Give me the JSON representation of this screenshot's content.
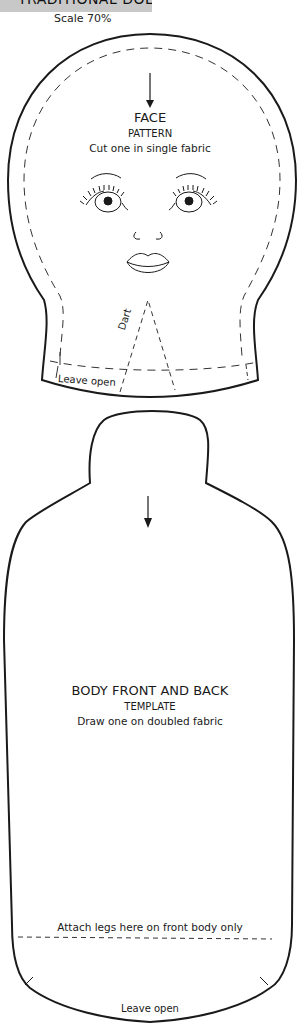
{
  "header": {
    "title": "TRADITIONAL DOLL",
    "scale": "Scale 70%"
  },
  "face": {
    "title": "FACE",
    "subtitle": "PATTERN",
    "instruction": "Cut one in single fabric",
    "dart_label": "Dart",
    "leave_open": "Leave open"
  },
  "body": {
    "title": "BODY FRONT AND BACK",
    "subtitle": "TEMPLATE",
    "instruction": "Draw one on doubled fabric",
    "attach_legs": "Attach legs here on front body only",
    "leave_open": "Leave open"
  },
  "colors": {
    "line": "#1a1a1a",
    "header_bg": "#c8c8c8"
  }
}
